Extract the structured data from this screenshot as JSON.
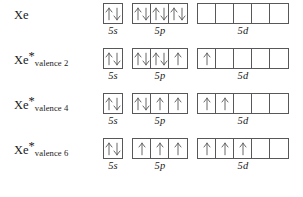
{
  "figure": {
    "line_color": "#58585a",
    "text_color": "#1a1a1a",
    "background": "#ffffff"
  },
  "orbital_labels": {
    "s": "5s",
    "p": "5p",
    "d": "5d"
  },
  "rows": [
    {
      "label_base": "Xe",
      "label_star": "",
      "label_sub": "",
      "subshells": {
        "s": [
          "updown"
        ],
        "p": [
          "updown",
          "updown",
          "updown"
        ],
        "d": [
          "",
          "",
          "",
          "",
          ""
        ]
      }
    },
    {
      "label_base": "Xe",
      "label_star": "*",
      "label_sub": "valence 2",
      "subshells": {
        "s": [
          "updown"
        ],
        "p": [
          "updown",
          "updown",
          "up"
        ],
        "d": [
          "up",
          "",
          "",
          "",
          ""
        ]
      }
    },
    {
      "label_base": "Xe",
      "label_star": "*",
      "label_sub": "valence 4",
      "subshells": {
        "s": [
          "updown"
        ],
        "p": [
          "updown",
          "up",
          "up"
        ],
        "d": [
          "up",
          "up",
          "",
          "",
          ""
        ]
      }
    },
    {
      "label_base": "Xe",
      "label_star": "*",
      "label_sub": "valence 6",
      "subshells": {
        "s": [
          "updown"
        ],
        "p": [
          "up",
          "up",
          "up"
        ],
        "d": [
          "up",
          "up",
          "up",
          "",
          ""
        ]
      }
    }
  ]
}
